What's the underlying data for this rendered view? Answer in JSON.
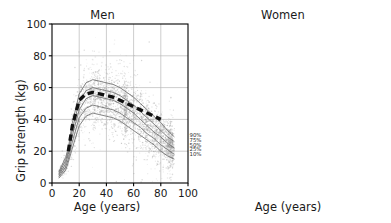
{
  "figure": {
    "background": "#ffffff",
    "axis_color": "#000000",
    "grid_color": "#b8b8b8",
    "cloud_color": "#9a9a9a",
    "percentile_color": "#6e6e6e",
    "ache_color": "#111111"
  },
  "axes": {
    "ylabel": "Grip strength (kg)",
    "xlabel": "Age (years)",
    "yticks": [
      0,
      20,
      40,
      60,
      80,
      100
    ],
    "xticks": [
      0,
      20,
      40,
      60,
      80,
      100
    ],
    "ylim": [
      0,
      100
    ],
    "xlim": [
      0,
      100
    ],
    "grid": true
  },
  "panels": [
    {
      "key": "men",
      "title": "Men"
    },
    {
      "key": "women",
      "title": "Women"
    }
  ],
  "annotations": {
    "uk": "U.K.",
    "ache": "Aché"
  },
  "chart_data": {
    "type": "line",
    "title": "",
    "subtitle": "",
    "xlabel": "Age (years)",
    "ylabel": "Grip strength (kg)",
    "xlim": [
      0,
      100
    ],
    "ylim": [
      0,
      100
    ],
    "grid": true,
    "legend_position": "inline-right-of-curves",
    "panels": [
      {
        "name": "Men",
        "x": [
          5,
          10,
          12,
          15,
          20,
          25,
          30,
          35,
          40,
          45,
          50,
          55,
          60,
          65,
          70,
          75,
          80,
          85,
          90
        ],
        "series": [
          {
            "name": "90%",
            "label": "90%",
            "group": "U.K.",
            "style": "thin-solid-gray",
            "values": [
              7,
              16,
              22,
              38,
              56,
              63,
              65,
              64,
              63,
              62,
              60,
              57,
              54,
              50,
              46,
              42,
              38,
              33,
              29
            ]
          },
          {
            "name": "75%",
            "label": "75%",
            "group": "U.K.",
            "style": "thin-solid-gray",
            "values": [
              6,
              14,
              20,
              34,
              51,
              58,
              60,
              59,
              58,
              57,
              55,
              52,
              49,
              45,
              41,
              37,
              33,
              29,
              26
            ]
          },
          {
            "name": "50%",
            "label": "50%",
            "group": "U.K.",
            "style": "thin-solid-gray",
            "values": [
              5,
              12,
              18,
              30,
              46,
              53,
              55,
              54,
              53,
              52,
              50,
              47,
              44,
              40,
              36,
              32,
              29,
              25,
              22
            ]
          },
          {
            "name": "25%",
            "label": "25%",
            "group": "U.K.",
            "style": "thin-solid-gray",
            "values": [
              4,
              10,
              15,
              26,
              41,
              47,
              49,
              48,
              47,
              46,
              44,
              41,
              38,
              35,
              31,
              28,
              24,
              21,
              18
            ]
          },
          {
            "name": "10%",
            "label": "10%",
            "group": "U.K.",
            "style": "thin-solid-gray",
            "values": [
              3,
              8,
              13,
              22,
              36,
              42,
              44,
              43,
              42,
              41,
              39,
              36,
              33,
              30,
              27,
              24,
              20,
              17,
              15
            ]
          },
          {
            "name": "Aché",
            "label": "Aché",
            "group": "Aché",
            "style": "thick-black-dashed",
            "values": [
              null,
              null,
              20,
              36,
              52,
              56,
              57,
              56,
              55,
              54,
              52,
              50,
              48,
              46,
              44,
              42,
              40,
              null,
              null
            ]
          }
        ],
        "scatter": {
          "name": "U.K. individuals",
          "color": "#9a9a9a",
          "approx_n": 4000,
          "x_range": [
            4,
            92
          ],
          "y_range": [
            3,
            82
          ]
        },
        "percentile_labels": [
          "90%",
          "75%",
          "50%",
          "25%",
          "10%"
        ],
        "percentile_label_y": [
          30,
          27,
          24,
          21,
          18
        ]
      },
      {
        "name": "Women",
        "x": [
          5,
          10,
          12,
          15,
          20,
          25,
          30,
          35,
          40,
          45,
          50,
          55,
          60,
          65,
          70,
          75,
          80,
          85,
          90
        ],
        "series": [
          {
            "name": "90%",
            "label": "90%",
            "group": "U.K.",
            "style": "thin-solid-gray",
            "values": [
              6,
              13,
              18,
              28,
              38,
              40,
              41,
              41,
              40,
              39,
              38,
              36,
              34,
              31,
              28,
              25,
              23,
              20,
              17
            ]
          },
          {
            "name": "75%",
            "label": "75%",
            "group": "U.K.",
            "style": "thin-solid-gray",
            "values": [
              5,
              12,
              17,
              26,
              35,
              37,
              38,
              38,
              37,
              36,
              35,
              33,
              31,
              28,
              26,
              23,
              21,
              18,
              15
            ]
          },
          {
            "name": "50%",
            "label": "50%",
            "group": "U.K.",
            "style": "thin-solid-gray",
            "values": [
              4,
              10,
              15,
              23,
              31,
              33,
              34,
              34,
              33,
              32,
              31,
              29,
              27,
              25,
              22,
              20,
              18,
              15,
              13
            ]
          },
          {
            "name": "25%",
            "label": "25%",
            "group": "U.K.",
            "style": "thin-solid-gray",
            "values": [
              4,
              9,
              13,
              20,
              27,
              29,
              30,
              30,
              29,
              28,
              27,
              25,
              23,
              21,
              19,
              17,
              15,
              13,
              11
            ]
          },
          {
            "name": "10%",
            "label": "10%",
            "group": "U.K.",
            "style": "thin-solid-gray",
            "values": [
              3,
              7,
              11,
              17,
              23,
              25,
              26,
              26,
              25,
              24,
              23,
              21,
              20,
              18,
              16,
              14,
              12,
              10,
              9
            ]
          },
          {
            "name": "Aché",
            "label": "Aché",
            "group": "Aché",
            "style": "thick-black-dashed",
            "values": [
              null,
              null,
              16,
              31,
              38,
              38,
              37,
              36,
              35,
              34,
              33,
              32,
              31,
              30,
              29,
              null,
              null,
              null,
              null
            ]
          }
        ],
        "scatter": {
          "name": "U.K. individuals",
          "color": "#9a9a9a",
          "approx_n": 4000,
          "x_range": [
            5,
            92
          ],
          "y_range": [
            2,
            62
          ]
        },
        "percentile_labels": [
          "90%",
          "50%",
          "10%"
        ],
        "percentile_label_y": [
          18,
          15,
          12
        ]
      }
    ]
  }
}
